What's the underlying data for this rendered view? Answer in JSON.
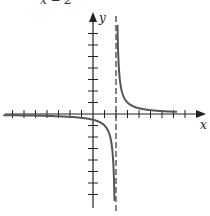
{
  "chart_data": {
    "type": "line",
    "title": "x − 2",
    "function": "y = 1/(x - 2)",
    "xlabel": "x",
    "ylabel": "y",
    "xlim": [
      -8,
      9
    ],
    "ylim": [
      -8,
      8
    ],
    "grid": false,
    "tick_spacing": 1,
    "vertical_asymptote": 2,
    "horizontal_asymptote": 0,
    "series": [
      {
        "name": "left branch",
        "x": [
          -8,
          -6,
          -4,
          -2,
          0,
          1,
          1.5,
          1.8,
          1.9
        ],
        "y": [
          -0.1,
          -0.125,
          -0.167,
          -0.25,
          -0.5,
          -1,
          -2,
          -5,
          -10
        ]
      },
      {
        "name": "right branch",
        "x": [
          2.1,
          2.2,
          2.5,
          3,
          4,
          6,
          8
        ],
        "y": [
          10,
          5,
          2,
          1,
          0.5,
          0.25,
          0.167
        ]
      }
    ],
    "colors": {
      "curve": "#555555",
      "axes": "#222222",
      "asymptote": "#444444"
    }
  },
  "labels": {
    "x_axis": "x",
    "y_axis": "y",
    "top_text": "x − 2"
  }
}
